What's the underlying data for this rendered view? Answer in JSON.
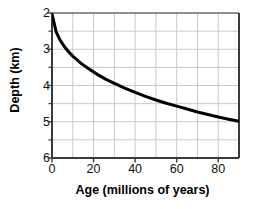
{
  "chart_data": {
    "type": "line",
    "title": "",
    "xlabel": "Age (millions of years)",
    "ylabel": "Depth (km)",
    "xlim": [
      0,
      90
    ],
    "ylim": [
      2,
      6
    ],
    "y_axis_inverted": true,
    "grid": true,
    "grid_x_step": 10,
    "grid_y_step": 0.5,
    "legend": null,
    "x_ticks": [
      {
        "value": 0,
        "label": "0"
      },
      {
        "value": 20,
        "label": "20"
      },
      {
        "value": 40,
        "label": "40"
      },
      {
        "value": 60,
        "label": "60"
      },
      {
        "value": 80,
        "label": "80"
      }
    ],
    "y_ticks": [
      {
        "value": 2,
        "label": "2"
      },
      {
        "value": 3,
        "label": "3"
      },
      {
        "value": 4,
        "label": "4"
      },
      {
        "value": 5,
        "label": "5"
      },
      {
        "value": 6,
        "label": "6"
      }
    ],
    "series": [
      {
        "name": "Ocean floor depth vs age",
        "color": "#000000",
        "line_width": 3,
        "x": [
          0,
          2,
          4,
          6,
          8,
          10,
          14,
          18,
          22,
          26,
          30,
          35,
          40,
          45,
          50,
          55,
          60,
          65,
          70,
          75,
          80,
          85,
          90
        ],
        "y": [
          2.02,
          2.52,
          2.76,
          2.93,
          3.07,
          3.19,
          3.39,
          3.55,
          3.7,
          3.83,
          3.94,
          4.07,
          4.19,
          4.3,
          4.4,
          4.49,
          4.57,
          4.65,
          4.73,
          4.8,
          4.87,
          4.93,
          4.99
        ]
      }
    ],
    "axis_color": "#555555",
    "grid_color": "#c9c9c9",
    "background": "#ffffff"
  },
  "plot_geometry": {
    "left": 52,
    "top": 13,
    "right": 239,
    "bottom": 158
  }
}
